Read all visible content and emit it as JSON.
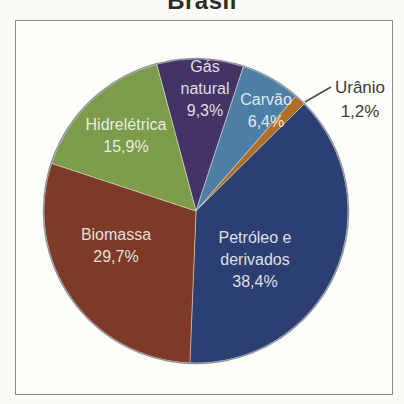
{
  "title": "Brasil",
  "chart_data": {
    "type": "pie",
    "title": "Brasil",
    "unit": "%",
    "decimal_separator": ",",
    "legend": "none (labels on slices)",
    "slices": [
      {
        "name": "Gás natural",
        "value": 9.3,
        "pct_label": "9,3%",
        "color": "#443465",
        "label": {
          "lines": [
            "Gás",
            "natural",
            "9,3%"
          ],
          "x": 205,
          "y": 67,
          "placement": "inside"
        }
      },
      {
        "name": "Carvão",
        "value": 6.4,
        "pct_label": "6,4%",
        "color": "#4d7ea6",
        "label": {
          "lines": [
            "Carvão",
            "6,4%"
          ],
          "x": 266,
          "y": 100,
          "placement": "inside"
        }
      },
      {
        "name": "Urânio",
        "value": 1.2,
        "pct_label": "1,2%",
        "color": "#ad6e25",
        "label": {
          "lines": [
            "Urânio",
            "1,2%"
          ],
          "x": 360,
          "y": 88,
          "placement": "outside",
          "leader": [
            331,
            87,
            305,
            102
          ]
        }
      },
      {
        "name": "Petróleo e derivados",
        "value": 38.4,
        "pct_label": "38,4%",
        "color": "#2b3f72",
        "label": {
          "lines": [
            "Petróleo e",
            "derivados",
            "38,4%"
          ],
          "x": 255,
          "y": 238,
          "placement": "inside"
        }
      },
      {
        "name": "Biomassa",
        "value": 29.7,
        "pct_label": "29,7%",
        "color": "#7d3a26",
        "label": {
          "lines": [
            "Biomassa",
            "29,7%"
          ],
          "x": 116,
          "y": 235,
          "placement": "inside"
        }
      },
      {
        "name": "Hidrelétrica",
        "value": 15.9,
        "pct_label": "15,9%",
        "color": "#7c9b4b",
        "label": {
          "lines": [
            "Hidrelétrica",
            "15,9%"
          ],
          "x": 126,
          "y": 125,
          "placement": "inside"
        }
      }
    ],
    "geometry": {
      "cx": 196,
      "cy": 211,
      "r": 152,
      "start_angle_deg": 345,
      "direction": "clockwise"
    },
    "styles": {
      "inside_label_color": "rgba(255,255,255,0.85)",
      "outside_label_color": "#3a3a3a",
      "rim_color": "#8f949c",
      "separator_color": "rgba(245,242,230,0.55)",
      "leader_color": "#4a4a4a",
      "line_height": 22,
      "outside_line_height": 24
    }
  }
}
